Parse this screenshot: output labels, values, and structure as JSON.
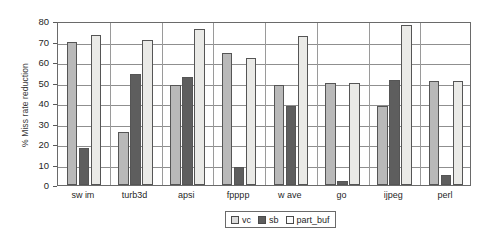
{
  "chart_data": {
    "type": "bar",
    "title": "",
    "xlabel": "",
    "ylabel": "% Miss rate reduction",
    "ylim": [
      0,
      80
    ],
    "ytick_step": 10,
    "yticks": [
      0,
      10,
      20,
      30,
      40,
      50,
      60,
      70,
      80
    ],
    "grid": true,
    "legend_position": "bottom-center",
    "categories": [
      "sw im",
      "turb3d",
      "apsi",
      "fpppp",
      "w ave",
      "go",
      "ijpeg",
      "perl"
    ],
    "series": [
      {
        "name": "vc",
        "color": "#b9b9b9",
        "values": [
          70,
          26,
          49,
          64.5,
          49,
          50,
          38.5,
          50.5
        ]
      },
      {
        "name": "sb",
        "color": "#5e5e5e",
        "values": [
          18,
          54,
          52.5,
          9,
          38.5,
          2,
          51,
          5
        ]
      },
      {
        "name": "part_buf",
        "color": "#eaeae7",
        "values": [
          73,
          70.5,
          76,
          62,
          72.5,
          50,
          78,
          50.5
        ]
      }
    ]
  },
  "legend": {
    "entries": [
      {
        "label": "vc"
      },
      {
        "label": "sb"
      },
      {
        "label": "part_buf"
      }
    ]
  },
  "axis": {
    "y_title": "% Miss rate reduction"
  }
}
